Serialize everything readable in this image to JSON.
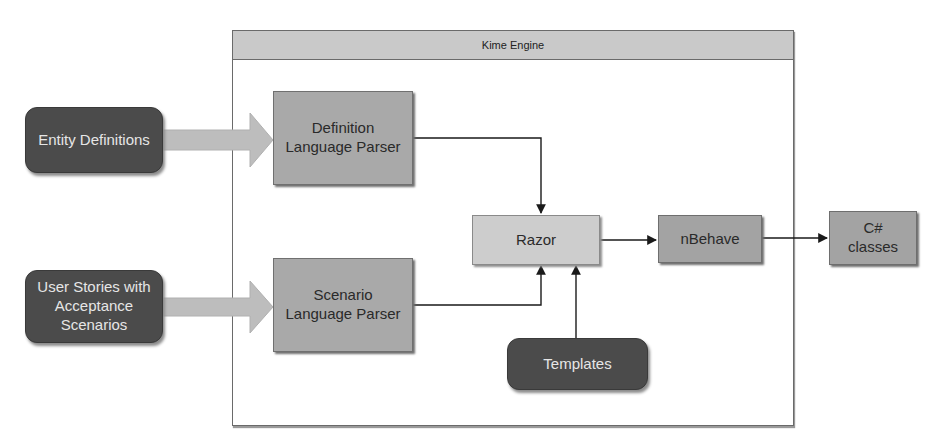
{
  "diagram": {
    "container": {
      "title": "Kime Engine"
    },
    "inputs": [
      {
        "id": "entity-definitions",
        "label": "Entity Definitions"
      },
      {
        "id": "user-stories",
        "label": "User Stories with Acceptance Scenarios"
      }
    ],
    "parsers": [
      {
        "id": "definition-parser",
        "label": "Definition Language Parser"
      },
      {
        "id": "scenario-parser",
        "label": "Scenario Language Parser"
      }
    ],
    "razor": {
      "label": "Razor"
    },
    "templates": {
      "label": "Templates"
    },
    "nbehave": {
      "label": "nBehave"
    },
    "output": {
      "label": "C# classes"
    },
    "edges": [
      {
        "from": "Entity Definitions",
        "to": "Definition Language Parser",
        "style": "block-arrow"
      },
      {
        "from": "User Stories with Acceptance Scenarios",
        "to": "Scenario Language Parser",
        "style": "block-arrow"
      },
      {
        "from": "Definition Language Parser",
        "to": "Razor",
        "style": "elbow-arrow"
      },
      {
        "from": "Scenario Language Parser",
        "to": "Razor",
        "style": "elbow-arrow"
      },
      {
        "from": "Templates",
        "to": "Razor",
        "style": "arrow"
      },
      {
        "from": "Razor",
        "to": "nBehave",
        "style": "arrow"
      },
      {
        "from": "nBehave",
        "to": "C# classes",
        "style": "arrow"
      }
    ],
    "colors": {
      "dark_node": "#4b4b4b",
      "parser_node": "#a9a9a9",
      "light_node": "#cdcdcd",
      "header": "#c9c9c9",
      "block_arrow": "#bdbdbd",
      "line": "#1a1a1a"
    }
  }
}
